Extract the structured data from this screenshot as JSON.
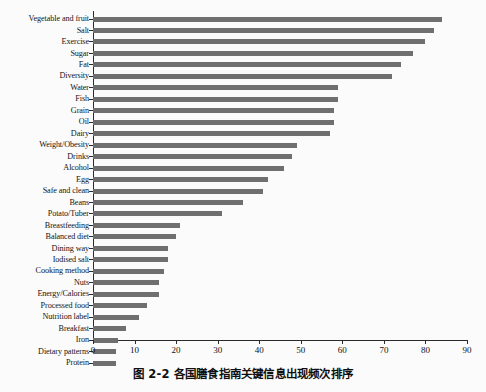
{
  "caption": "图 2-2  各国膳食指南关键信息出现频次排序",
  "colors": {
    "bar": "#6f6f6f",
    "axis": "#2a2a2a",
    "background": "#fbfbfb",
    "text": "#111111"
  },
  "chart_data": {
    "type": "bar",
    "orientation": "horizontal",
    "title": "",
    "xlabel": "",
    "ylabel": "",
    "xlim": [
      0,
      90
    ],
    "xticks": [
      0,
      10,
      20,
      30,
      40,
      50,
      60,
      70,
      80,
      90
    ],
    "grid": false,
    "legend": false,
    "categories": [
      "Vegetable and fruit",
      "Salt",
      "Exercise",
      "Sugar",
      "Fat",
      "Diversity",
      "Water",
      "Fish",
      "Grain",
      "Oil",
      "Dairy",
      "Weight/Obesity",
      "Drinks",
      "Alcohol",
      "Egg",
      "Safe and clean",
      "Beans",
      "Potato/Tuber",
      "Breastfeeding",
      "Balanced diet",
      "Dining way",
      "Iodised salt",
      "Cooking method",
      "Nuts",
      "Energy/Calories",
      "Processed food",
      "Nutrition label",
      "Breakfast",
      "Iron",
      "Dietary patterns",
      "Protein"
    ],
    "values": [
      84,
      82,
      80,
      77,
      74,
      72,
      59,
      59,
      58,
      58,
      57,
      49,
      48,
      46,
      42,
      41,
      36,
      31,
      21,
      20,
      18,
      18,
      17,
      16,
      16,
      13,
      11,
      8,
      6,
      5.5,
      5.5
    ]
  }
}
